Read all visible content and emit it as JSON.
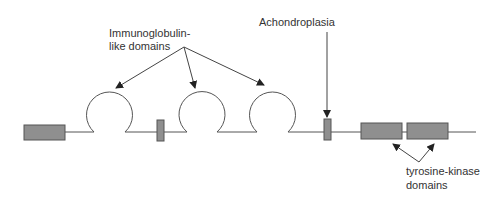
{
  "diagram": {
    "labels": {
      "ig_line1": "Immunoglobulin-",
      "ig_line2": "like domains",
      "achondroplasia": "Achondroplasia",
      "tk_line1": "tyrosine-kinase",
      "tk_line2": "domains"
    },
    "components": [
      {
        "type": "box",
        "name": "signal-peptide"
      },
      {
        "type": "loop",
        "name": "ig-domain-1"
      },
      {
        "type": "box",
        "name": "acid-box"
      },
      {
        "type": "loop",
        "name": "ig-domain-2"
      },
      {
        "type": "loop",
        "name": "ig-domain-3"
      },
      {
        "type": "box",
        "name": "transmembrane-domain"
      },
      {
        "type": "box",
        "name": "tyrosine-kinase-domain-1"
      },
      {
        "type": "box",
        "name": "tyrosine-kinase-domain-2"
      }
    ],
    "colors": {
      "box_fill": "#8f8f8f",
      "stroke": "#555555",
      "text": "#333333"
    }
  }
}
